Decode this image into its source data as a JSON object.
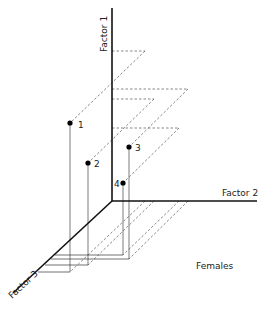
{
  "diagram": {
    "title": "Females",
    "axes": {
      "factor1": {
        "label": "Factor 1"
      },
      "factor2": {
        "label": "Factor 2"
      },
      "factor3": {
        "label": "Factor 3"
      }
    },
    "points": [
      {
        "id": "1",
        "label": "1"
      },
      {
        "id": "2",
        "label": "2"
      },
      {
        "id": "3",
        "label": "3"
      },
      {
        "id": "4",
        "label": "4"
      }
    ]
  }
}
